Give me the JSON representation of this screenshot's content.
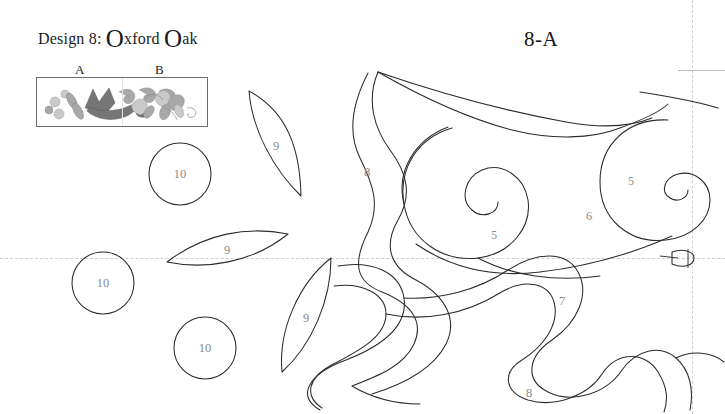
{
  "page": {
    "title_prefix": "Design 8: ",
    "title_word1_cap": "O",
    "title_word1_rest": "xford ",
    "title_word2_cap": "O",
    "title_word2_rest": "ak",
    "title_full": "Design 8: Oxford Oak",
    "sheet_code": "8-A",
    "background_color": "#ffffff",
    "ink_color": "#2b2b2b",
    "label_color": "#8a8a8a",
    "guide_color": "#cfcfcf"
  },
  "thumbnail": {
    "label_a": "A",
    "label_b": "B",
    "border_color": "#6d6d6d",
    "dark_fill": "#767676",
    "mid_fill": "#a8a8a8",
    "light_fill": "#c9c9c9"
  },
  "pattern_pieces": [
    {
      "label": "10",
      "shape": "circle",
      "name": "acorn-cup-circle-top",
      "cx": 180,
      "cy": 174,
      "r": 31
    },
    {
      "label": "10",
      "shape": "circle",
      "name": "acorn-cup-circle-left",
      "cx": 103,
      "cy": 283,
      "r": 31
    },
    {
      "label": "10",
      "shape": "circle",
      "name": "acorn-cup-circle-bottom",
      "cx": 205,
      "cy": 348,
      "r": 31
    },
    {
      "label": "9",
      "shape": "leaf",
      "name": "leaf-upper",
      "cx": 276,
      "cy": 146
    },
    {
      "label": "9",
      "shape": "leaf",
      "name": "leaf-middle",
      "cx": 227,
      "cy": 250
    },
    {
      "label": "9",
      "shape": "leaf",
      "name": "leaf-lower",
      "cx": 306,
      "cy": 318
    },
    {
      "label": "8",
      "shape": "vine",
      "name": "vine-stem-upper",
      "cx": 367,
      "cy": 172
    },
    {
      "label": "8",
      "shape": "vine",
      "name": "vine-stem-lower",
      "cx": 529,
      "cy": 393
    },
    {
      "label": "5",
      "shape": "scroll",
      "name": "scroll-curl-left",
      "cx": 494,
      "cy": 235
    },
    {
      "label": "5",
      "shape": "scroll",
      "name": "scroll-curl-right",
      "cx": 631,
      "cy": 181
    },
    {
      "label": "6",
      "shape": "region",
      "name": "oak-body-region",
      "cx": 589,
      "cy": 216
    },
    {
      "label": "7",
      "shape": "region",
      "name": "background-region",
      "cx": 562,
      "cy": 301
    }
  ],
  "guides": {
    "horizontal_y": 258,
    "vertical_x": 692,
    "tick_y": 70,
    "style": "dashed"
  }
}
